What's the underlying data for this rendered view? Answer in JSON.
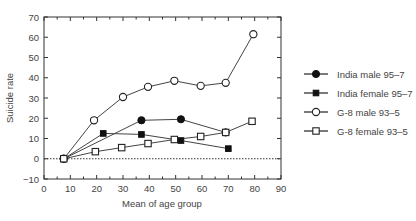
{
  "chart_data": {
    "type": "line",
    "title": "",
    "xlabel": "Mean of age group",
    "ylabel": "Suicide rate",
    "xlim": [
      0,
      90
    ],
    "ylim": [
      -10,
      70
    ],
    "x_ticks": [
      0,
      10,
      20,
      30,
      40,
      50,
      60,
      70,
      80,
      90
    ],
    "y_ticks": [
      -10,
      0,
      10,
      20,
      30,
      40,
      50,
      60,
      70
    ],
    "x_tick_labels": [
      "0",
      "10",
      "20",
      "30",
      "40",
      "50",
      "60",
      "70",
      "80",
      "90"
    ],
    "y_tick_labels": [
      "−10",
      "0",
      "10",
      "20",
      "30",
      "40",
      "50",
      "60",
      "70"
    ],
    "grid": false,
    "reference_line": {
      "y": 0,
      "style": "dotted"
    },
    "legend_position": "right",
    "series": [
      {
        "name": "India male 95–7",
        "marker": "filled-circle",
        "points": [
          [
            7.5,
            0
          ],
          [
            37,
            19
          ],
          [
            52,
            19.5
          ],
          [
            69,
            13
          ]
        ]
      },
      {
        "name": "India female 95–7",
        "marker": "filled-square",
        "points": [
          [
            7.5,
            0
          ],
          [
            22.5,
            12.5
          ],
          [
            37,
            12
          ],
          [
            52,
            9
          ],
          [
            70,
            5
          ]
        ]
      },
      {
        "name": "G-8 male 93–5",
        "marker": "open-circle",
        "points": [
          [
            7.5,
            0
          ],
          [
            19,
            19
          ],
          [
            30,
            30.5
          ],
          [
            39.5,
            35.5
          ],
          [
            49.5,
            38.5
          ],
          [
            59.5,
            36
          ],
          [
            69,
            37.5
          ],
          [
            79.5,
            61.5
          ]
        ]
      },
      {
        "name": "G-8 female 93–5",
        "marker": "open-square",
        "points": [
          [
            7.5,
            0
          ],
          [
            19.5,
            3.5
          ],
          [
            29.5,
            5.5
          ],
          [
            39.5,
            7.5
          ],
          [
            49.5,
            9.5
          ],
          [
            59.5,
            11
          ],
          [
            69,
            13
          ],
          [
            79,
            18.5
          ]
        ]
      }
    ]
  },
  "colors": {
    "axis": "#333333",
    "series_line": "#444444",
    "text": "#444444",
    "background": "#ffffff"
  }
}
